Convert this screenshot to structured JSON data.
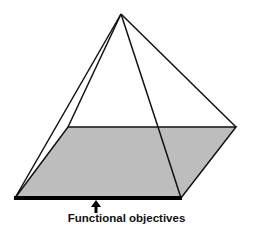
{
  "diagram": {
    "type": "pyramid",
    "base_fill": "#bdbdbd",
    "stroke": "#111111",
    "label": "Functional objectives",
    "arrow": "up-arrow"
  }
}
